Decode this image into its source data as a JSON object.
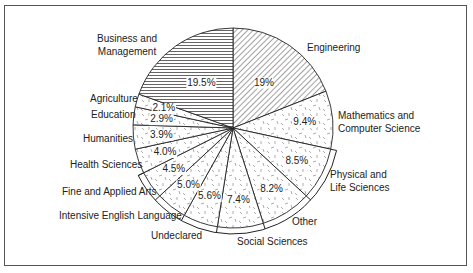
{
  "chart_data": {
    "type": "pie",
    "title": "",
    "start_angle_deg": 0,
    "direction": "clockwise",
    "slices": [
      {
        "label": "Engineering",
        "value": 19.0,
        "pct_label": "19%",
        "pattern": "diagonal"
      },
      {
        "label": "Mathematics and Computer Science",
        "value": 9.4,
        "pct_label": "9.4%",
        "pattern": "stipple"
      },
      {
        "label": "Physical and Life Sciences",
        "value": 8.5,
        "pct_label": "8.5%",
        "pattern": "stipple"
      },
      {
        "label": "Other",
        "value": 8.2,
        "pct_label": "8.2%",
        "pattern": "stipple"
      },
      {
        "label": "Social Sciences",
        "value": 7.4,
        "pct_label": "7.4%",
        "pattern": "stipple"
      },
      {
        "label": "Undeclared",
        "value": 5.6,
        "pct_label": "5.6%",
        "pattern": "stipple"
      },
      {
        "label": "Intensive English Language",
        "value": 5.0,
        "pct_label": "5.0%",
        "pattern": "stipple"
      },
      {
        "label": "Fine and Applied Arts",
        "value": 4.5,
        "pct_label": "4.5%",
        "pattern": "stipple"
      },
      {
        "label": "Health Sciences",
        "value": 4.0,
        "pct_label": "4.0%",
        "pattern": "stipple"
      },
      {
        "label": "Humanities",
        "value": 3.9,
        "pct_label": "3.9%",
        "pattern": "stipple"
      },
      {
        "label": "Education",
        "value": 2.9,
        "pct_label": "2.9%",
        "pattern": "stipple"
      },
      {
        "label": "Agriculture",
        "value": 2.1,
        "pct_label": "2.1%",
        "pattern": "stipple"
      },
      {
        "label": "Business and Management",
        "value": 19.5,
        "pct_label": "19.5%",
        "pattern": "horizontal"
      }
    ],
    "outer_band": {
      "from_label": "Physical and Life Sciences",
      "to_label": "Fine and Applied Arts"
    }
  },
  "labels": {
    "business": [
      "Business and",
      "Management"
    ],
    "engineering": [
      "Engineering"
    ],
    "math": [
      "Mathematics and",
      "Computer Science"
    ],
    "physical": [
      "Physical and",
      "Life Sciences"
    ],
    "other": [
      "Other"
    ],
    "social": [
      "Social Sciences"
    ],
    "undeclared": [
      "Undeclared"
    ],
    "english": [
      "Intensive English Language"
    ],
    "fine_arts": [
      "Fine and Applied Arts"
    ],
    "health": [
      "Health Sciences"
    ],
    "humanities": [
      "Humanities"
    ],
    "education": [
      "Education"
    ],
    "agriculture": [
      "Agriculture"
    ]
  }
}
